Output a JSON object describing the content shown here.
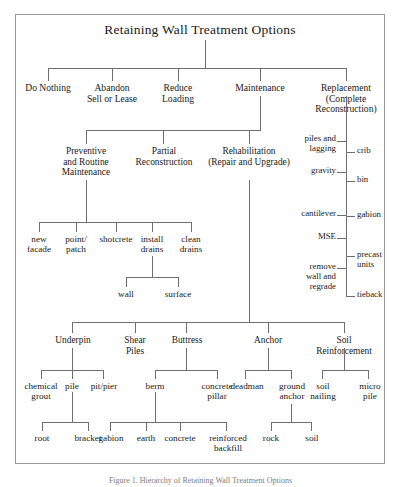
{
  "figure": {
    "title": "Retaining Wall Treatment Options",
    "caption": "Figure 1. Hierarchy of Retaining Wall Treatment Options"
  },
  "level1": {
    "do_nothing": "Do Nothing",
    "abandon_l1": "Abandon",
    "abandon_l2": "Sell or Lease",
    "reduce_l1": "Reduce",
    "reduce_l2": "Loading",
    "maintenance": "Maintenance",
    "replacement_l1": "Replacement",
    "replacement_l2": "(Complete",
    "replacement_l3": "Reconstruction)"
  },
  "maintenance_children": {
    "preventive_l1": "Preventive",
    "preventive_l2": "and Routine",
    "preventive_l3": "Maintenance",
    "partial_l1": "Partial",
    "partial_l2": "Reconstruction",
    "rehab_l1": "Rehabilitation",
    "rehab_l2": "(Repair and Upgrade)"
  },
  "preventive_children": {
    "new_l1": "new",
    "new_l2": "facade",
    "point_l1": "point/",
    "point_l2": "patch",
    "shotcrete": "shotcrete",
    "install_l1": "install",
    "install_l2": "drains",
    "clean_l1": "clean",
    "clean_l2": "drains",
    "wall": "wall",
    "surface": "surface"
  },
  "replacement_left": [
    {
      "l1": "piles and",
      "l2": "lagging"
    },
    {
      "l1": "gravity",
      "l2": ""
    },
    {
      "l1": "cantilever",
      "l2": ""
    },
    {
      "l1": "MSE",
      "l2": ""
    },
    {
      "l1": "remove",
      "l2": "wall and",
      "l3": "regrade"
    }
  ],
  "replacement_right": [
    {
      "l1": "crib",
      "l2": ""
    },
    {
      "l1": "bin",
      "l2": ""
    },
    {
      "l1": "gabion",
      "l2": ""
    },
    {
      "l1": "precast",
      "l2": "units"
    },
    {
      "l1": "tieback",
      "l2": ""
    }
  ],
  "rehab_children": {
    "underpin": "Underpin",
    "shear_l1": "Shear",
    "shear_l2": "Piles",
    "buttress": "Buttress",
    "anchor": "Anchor",
    "soil_l1": "Soil",
    "soil_l2": "Reinforcement"
  },
  "rehab_leaves": {
    "chemical_l1": "chemical",
    "chemical_l2": "grout",
    "pile": "pile",
    "pitpier": "pit/pier",
    "berm": "berm",
    "concrete_l1": "concrete",
    "concrete_l2": "pillar",
    "deadman": "deadman",
    "ground_l1": "ground",
    "ground_l2": "anchor",
    "soil_l1": "soil",
    "soil_l2": "nailing",
    "micro_l1": "micro",
    "micro_l2": "pile"
  },
  "bottom_leaves": {
    "root": "root",
    "bracket": "bracket",
    "gabion": "gabion",
    "earth": "earth",
    "concrete": "concrete",
    "reinforced_l1": "reinforced",
    "reinforced_l2": "backfill",
    "rock": "rock",
    "soil": "soil"
  },
  "colors": {
    "line": "#6f6f6f",
    "frame": "#9a9a9a",
    "text": "#1a1a1a"
  }
}
